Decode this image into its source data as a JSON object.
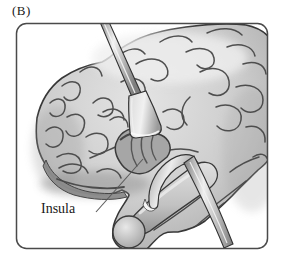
{
  "figure": {
    "panel_label": "(B)",
    "labels": {
      "insula": "Insula"
    },
    "illustration": {
      "kind": "anatomical-illustration",
      "subject": "lateral view of brain with two retractors exposing the insula"
    },
    "colors": {
      "background": "#ffffff",
      "frame_border": "#4a4a4a",
      "brain_base": "#cbcbcb",
      "sulci": "#474747",
      "insula_region": "#a6a6a6",
      "retractor_metal": "#d9d9d9",
      "label_text": "#1a1a1a"
    }
  }
}
